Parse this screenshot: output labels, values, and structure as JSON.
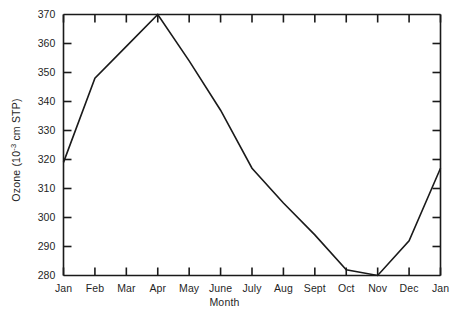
{
  "chart_data": {
    "type": "line",
    "title": "",
    "subtitle": "",
    "xlabel": "Month",
    "ylabel": "Ozone (10-3 cm STP)",
    "ylabel_parts": {
      "prefix": "Ozone (10",
      "exponent": "-3",
      "suffix": " cm STP)"
    },
    "categories": [
      "Jan",
      "Feb",
      "Mar",
      "Apr",
      "May",
      "June",
      "July",
      "Aug",
      "Sept",
      "Oct",
      "Nov",
      "Dec",
      "Jan"
    ],
    "values": [
      319,
      348,
      359,
      370,
      354,
      337,
      317,
      305,
      294,
      282,
      280,
      292,
      317
    ],
    "series": [
      {
        "name": "Ozone",
        "values": [
          319,
          348,
          359,
          370,
          354,
          337,
          317,
          305,
          294,
          282,
          280,
          292,
          317
        ]
      }
    ],
    "ylim": [
      280,
      370
    ],
    "yticks": [
      280,
      290,
      300,
      310,
      320,
      330,
      340,
      350,
      360,
      370
    ],
    "ytick_labels": [
      "280",
      "290",
      "300",
      "310",
      "320",
      "330",
      "340",
      "350",
      "360",
      "370"
    ],
    "xtick_labels": [
      "Jan",
      "Feb",
      "Mar",
      "Apr",
      "May",
      "June",
      "July",
      "Aug",
      "Sept",
      "Oct",
      "Nov",
      "Dec",
      "Jan"
    ],
    "grid": false,
    "legend": false,
    "legend_position": "none",
    "line_color": "#1a1a1a",
    "axis_color": "#1a1a1a",
    "background_color": "#ffffff",
    "ticks_both_sides": true,
    "annotations": []
  }
}
